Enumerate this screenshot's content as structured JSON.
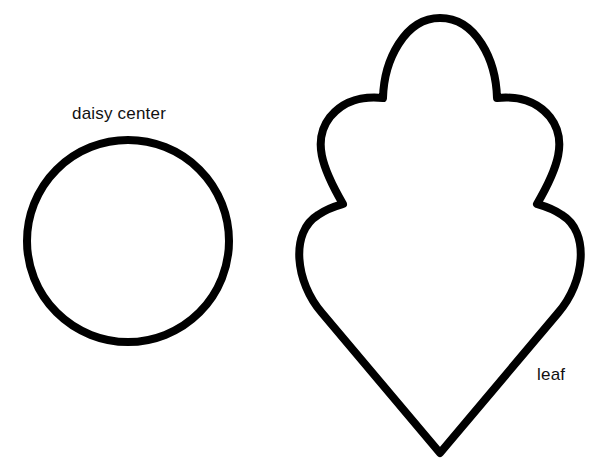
{
  "shapes": [
    {
      "id": "daisy-center",
      "kind": "circle",
      "label": "daisy center"
    },
    {
      "id": "leaf",
      "kind": "scalloped-leaf",
      "label": "leaf"
    }
  ],
  "colors": {
    "outline": "#000000",
    "background": "#ffffff",
    "text": "#111111"
  }
}
